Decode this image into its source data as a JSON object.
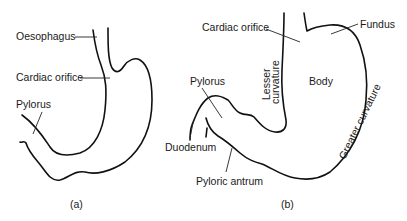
{
  "figure": {
    "panels": [
      {
        "id": "a",
        "caption": "(a)",
        "labels": {
          "oesophagus": "Oesophagus",
          "cardiac_orifice": "Cardiac orifice",
          "pylorus": "Pylorus"
        }
      },
      {
        "id": "b",
        "caption": "(b)",
        "labels": {
          "cardiac_orifice": "Cardiac orifice",
          "fundus": "Fundus",
          "body": "Body",
          "lesser_curvature_line1": "Lesser",
          "lesser_curvature_line2": "curvature",
          "greater_curvature": "Greater curvature",
          "pylorus": "Pylorus",
          "duodenum": "Duodenum",
          "pyloric_antrum": "Pyloric antrum"
        }
      }
    ],
    "colors": {
      "line": "#111111",
      "text": "#1a1a1a",
      "background": "#ffffff"
    }
  }
}
